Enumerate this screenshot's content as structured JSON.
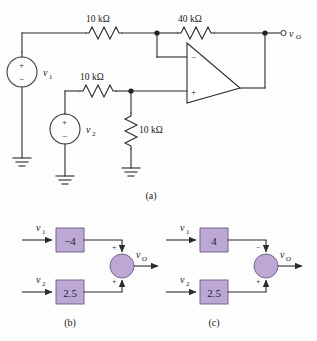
{
  "figure": {
    "background_color": "#fdfdfd",
    "line_color": "#2b2b2b",
    "block_fill_color": "#bda8d4",
    "block_stroke_color": "#6b5a86"
  },
  "circuit_a": {
    "caption": "(a)",
    "resistors": [
      {
        "id": "r-input-top",
        "label": "10 kΩ",
        "orientation": "horizontal"
      },
      {
        "id": "r-feedback",
        "label": "40 kΩ",
        "orientation": "horizontal"
      },
      {
        "id": "r-input-mid",
        "label": "10 kΩ",
        "orientation": "horizontal"
      },
      {
        "id": "r-shunt",
        "label": "10 kΩ",
        "orientation": "vertical"
      }
    ],
    "sources": [
      {
        "id": "source-v1",
        "label": "v",
        "sub": "1",
        "plus": "+",
        "minus": "−"
      },
      {
        "id": "source-v2",
        "label": "v",
        "sub": "2",
        "plus": "+",
        "minus": "−"
      }
    ],
    "opamp": {
      "inverting_sign": "−",
      "noninverting_sign": "+"
    },
    "output": {
      "label": "v",
      "sub": "O"
    }
  },
  "diagram_b": {
    "caption": "(b)",
    "inputs": [
      {
        "label": "v",
        "sub": "1"
      },
      {
        "label": "v",
        "sub": "2"
      }
    ],
    "gains": [
      {
        "value": "−4"
      },
      {
        "value": "2.5"
      }
    ],
    "summing_signs": {
      "top": "+",
      "bottom": "+"
    },
    "output": {
      "label": "v",
      "sub": "O"
    }
  },
  "diagram_c": {
    "caption": "(c)",
    "inputs": [
      {
        "label": "v",
        "sub": "1"
      },
      {
        "label": "v",
        "sub": "2"
      }
    ],
    "gains": [
      {
        "value": "4"
      },
      {
        "value": "2.5"
      }
    ],
    "summing_signs": {
      "top": "−",
      "bottom": "+"
    },
    "output": {
      "label": "v",
      "sub": "O"
    }
  }
}
